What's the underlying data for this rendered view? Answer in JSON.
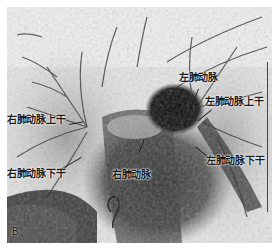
{
  "figure": {
    "panel_letter": "B",
    "labels": {
      "left_pulmonary_artery": "左肺动脉",
      "left_upper_trunk": "左肺动脉上干",
      "right_upper_trunk": "右肺动脉上干",
      "right_lower_trunk": "右肺动脉下干",
      "right_pulmonary_artery": "右肺动脉",
      "left_lower_trunk": "左肺动脉下干"
    },
    "colors": {
      "background": "#ffffff",
      "image_light": "#e6e6e6",
      "image_dark": "#111111",
      "label_text": "#1a1a1a"
    }
  }
}
